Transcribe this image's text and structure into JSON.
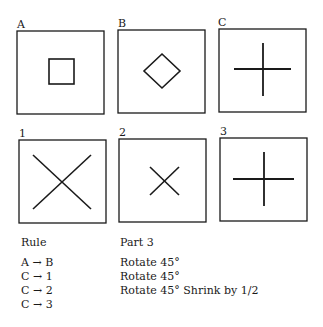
{
  "panels": [
    {
      "label": "A",
      "shape": "square",
      "description": "small square"
    },
    {
      "label": "B",
      "shape": "diamond",
      "description": "square rotated 45°"
    },
    {
      "label": "C",
      "shape": "plus",
      "description": "plus sign"
    },
    {
      "label": "1",
      "shape": "x-large",
      "description": "large X"
    },
    {
      "label": "2",
      "shape": "x-small",
      "description": "small X"
    },
    {
      "label": "3",
      "shape": "plus",
      "description": "plus sign"
    }
  ],
  "table": {
    "header_left": "Rule",
    "header_right": "Part 3",
    "rows": [
      {
        "rule": "A → B",
        "part": "Rotate 45°"
      },
      {
        "rule": "C → 1",
        "part": "Rotate 45°"
      },
      {
        "rule": "C → 2",
        "part": "Rotate 45° Shrink by 1/2"
      },
      {
        "rule": "C → 3",
        "part": ""
      }
    ]
  },
  "colors": {
    "stroke": "#1a1a1a",
    "background": "#ffffff"
  }
}
